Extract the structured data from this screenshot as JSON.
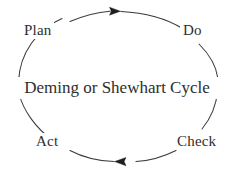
{
  "diagram": {
    "type": "cycle",
    "direction": "clockwise",
    "title": "Deming or Shewhart Cycle",
    "background_color": "#ffffff",
    "stroke_color": "#3a3a3a",
    "text_color": "#2e2e2e",
    "center": {
      "text": "Deming or Shewhart Cycle"
    },
    "nodes": [
      {
        "id": "plan",
        "label": "Plan",
        "position": "top-left"
      },
      {
        "id": "do",
        "label": "Do",
        "position": "top-right"
      },
      {
        "id": "check",
        "label": "Check",
        "position": "bottom-right"
      },
      {
        "id": "act",
        "label": "Act",
        "position": "bottom-left"
      }
    ],
    "arrows": [
      {
        "id": "arrow-top",
        "direction": "right",
        "between": "plan-to-do"
      },
      {
        "id": "arrow-right",
        "direction": "down",
        "between": "do-to-check"
      },
      {
        "id": "arrow-bottom",
        "direction": "left",
        "between": "check-to-act"
      },
      {
        "id": "arrow-left",
        "direction": "up",
        "between": "act-to-plan"
      }
    ]
  }
}
